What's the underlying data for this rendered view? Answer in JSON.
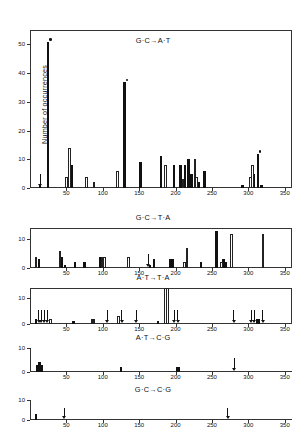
{
  "figure": {
    "ylabel": "Number of occurrences",
    "xlabel": ""
  },
  "chart_data": {
    "type": "bar",
    "xlabel": "",
    "ylabel": "Number of occurrences",
    "xlim": [
      0,
      360
    ],
    "xticks": [
      50,
      100,
      150,
      200,
      250,
      300,
      350
    ],
    "grid": false,
    "legend": "none",
    "panels": [
      {
        "label": "G·C→A·T",
        "ylim": [
          0,
          55
        ],
        "yticks": [
          0,
          10,
          20,
          30,
          40,
          50
        ],
        "series": [
          {
            "name": "filled",
            "points": [
              {
                "x": 14,
                "y": 1
              },
              {
                "x": 25,
                "y": 51,
                "marker": "dot"
              },
              {
                "x": 57,
                "y": 8
              },
              {
                "x": 130,
                "y": 37,
                "marker": "dot"
              },
              {
                "x": 152,
                "y": 9
              },
              {
                "x": 180,
                "y": 11
              },
              {
                "x": 198,
                "y": 8
              },
              {
                "x": 207,
                "y": 8
              },
              {
                "x": 213,
                "y": 8
              },
              {
                "x": 218,
                "y": 10
              },
              {
                "x": 222,
                "y": 5
              },
              {
                "x": 232,
                "y": 2
              },
              {
                "x": 240,
                "y": 6
              },
              {
                "x": 292,
                "y": 1
              },
              {
                "x": 308,
                "y": 5
              },
              {
                "x": 313,
                "y": 12,
                "marker": "dot"
              },
              {
                "x": 318,
                "y": 1
              }
            ]
          },
          {
            "name": "open",
            "points": [
              {
                "x": 50,
                "y": 4
              },
              {
                "x": 54,
                "y": 14
              },
              {
                "x": 78,
                "y": 4
              },
              {
                "x": 88,
                "y": 2
              },
              {
                "x": 120,
                "y": 6
              },
              {
                "x": 186,
                "y": 8
              },
              {
                "x": 210,
                "y": 3
              },
              {
                "x": 227,
                "y": 10
              },
              {
                "x": 229,
                "y": 4
              },
              {
                "x": 303,
                "y": 4
              },
              {
                "x": 306,
                "y": 8
              }
            ]
          }
        ],
        "arrows": [
          {
            "x": 14
          }
        ]
      },
      {
        "label": "G·C→T·A",
        "ylim": [
          0,
          14
        ],
        "yticks": [
          0,
          10
        ],
        "series": [
          {
            "name": "filled",
            "points": [
              {
                "x": 12,
                "y": 3
              },
              {
                "x": 44,
                "y": 4
              },
              {
                "x": 48,
                "y": 1
              },
              {
                "x": 62,
                "y": 2
              },
              {
                "x": 75,
                "y": 2
              },
              {
                "x": 96,
                "y": 4
              },
              {
                "x": 165,
                "y": 1
              },
              {
                "x": 170,
                "y": 3
              },
              {
                "x": 192,
                "y": 3
              },
              {
                "x": 196,
                "y": 3
              },
              {
                "x": 235,
                "y": 2
              },
              {
                "x": 256,
                "y": 13
              },
              {
                "x": 266,
                "y": 3
              },
              {
                "x": 269,
                "y": 2
              }
            ]
          },
          {
            "name": "open",
            "points": [
              {
                "x": 8,
                "y": 4
              },
              {
                "x": 41,
                "y": 6
              },
              {
                "x": 99,
                "y": 4
              },
              {
                "x": 102,
                "y": 4
              },
              {
                "x": 135,
                "y": 4
              },
              {
                "x": 212,
                "y": 2
              },
              {
                "x": 216,
                "y": 7
              },
              {
                "x": 263,
                "y": 2
              },
              {
                "x": 277,
                "y": 12
              },
              {
                "x": 320,
                "y": 12
              }
            ]
          }
        ],
        "arrows": [
          {
            "x": 163
          }
        ]
      },
      {
        "label": "A·T→T·A",
        "ylim": [
          0,
          14
        ],
        "yticks": [
          0,
          10
        ],
        "series": [
          {
            "name": "filled",
            "points": [
              {
                "x": 8,
                "y": 2
              },
              {
                "x": 60,
                "y": 1
              },
              {
                "x": 176,
                "y": 1
              },
              {
                "x": 312,
                "y": 2
              },
              {
                "x": 315,
                "y": 2
              }
            ]
          },
          {
            "name": "open",
            "points": [
              {
                "x": 28,
                "y": 2
              },
              {
                "x": 85,
                "y": 2
              },
              {
                "x": 88,
                "y": 2
              },
              {
                "x": 122,
                "y": 3
              },
              {
                "x": 186,
                "y": 14
              },
              {
                "x": 189,
                "y": 14
              }
            ]
          }
        ],
        "arrows": [
          {
            "x": 12
          },
          {
            "x": 16
          },
          {
            "x": 20
          },
          {
            "x": 24
          },
          {
            "x": 106
          },
          {
            "x": 126
          },
          {
            "x": 146
          },
          {
            "x": 198
          },
          {
            "x": 203
          },
          {
            "x": 280
          },
          {
            "x": 304
          },
          {
            "x": 308
          },
          {
            "x": 320
          }
        ]
      },
      {
        "label": "A·T→C·G",
        "ylim": [
          0,
          10
        ],
        "yticks": [
          0,
          10
        ],
        "series": [
          {
            "name": "filled",
            "points": [
              {
                "x": 10,
                "y": 3
              },
              {
                "x": 13,
                "y": 4
              },
              {
                "x": 16,
                "y": 3
              },
              {
                "x": 125,
                "y": 2
              },
              {
                "x": 202,
                "y": 2
              },
              {
                "x": 205,
                "y": 2
              }
            ]
          },
          {
            "name": "open",
            "points": []
          }
        ],
        "arrows": [
          {
            "x": 281
          }
        ]
      },
      {
        "label": "G·C→C·G",
        "ylim": [
          0,
          10
        ],
        "yticks": [
          0,
          10
        ],
        "series": [
          {
            "name": "filled",
            "points": [
              {
                "x": 8,
                "y": 3
              }
            ]
          },
          {
            "name": "open",
            "points": []
          }
        ],
        "arrows": [
          {
            "x": 47
          },
          {
            "x": 272
          }
        ]
      }
    ]
  }
}
